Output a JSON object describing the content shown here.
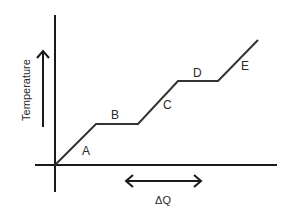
{
  "diagram": {
    "y_axis_label": "Temperature",
    "x_axis_label": "ΔQ",
    "colors": {
      "line": "#333333",
      "axis": "#1a1a1a",
      "background": "#ffffff"
    },
    "segments": [
      {
        "id": "A",
        "label": "A",
        "type": "rising"
      },
      {
        "id": "B",
        "label": "B",
        "type": "plateau"
      },
      {
        "id": "C",
        "label": "C",
        "type": "rising"
      },
      {
        "id": "D",
        "label": "D",
        "type": "plateau"
      },
      {
        "id": "E",
        "label": "E",
        "type": "rising"
      }
    ]
  }
}
